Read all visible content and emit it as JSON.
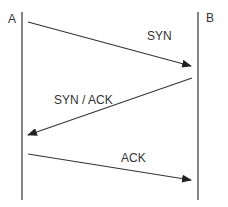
{
  "diagram": {
    "title": "",
    "type": "sequence",
    "participants": [
      {
        "id": "A",
        "label": "A",
        "x": 22
      },
      {
        "id": "B",
        "label": "B",
        "x": 198
      }
    ],
    "messages": [
      {
        "label": "SYN",
        "from": "A",
        "to": "B",
        "x1": 28,
        "y1": 22,
        "x2": 191,
        "y2": 66,
        "label_x": 147,
        "label_y": 37
      },
      {
        "label": "SYN / ACK",
        "from": "B",
        "to": "A",
        "x1": 192,
        "y1": 78,
        "x2": 28,
        "y2": 135,
        "label_x": 54,
        "label_y": 105
      },
      {
        "label": "ACK",
        "from": "A",
        "to": "B",
        "x1": 28,
        "y1": 154,
        "x2": 191,
        "y2": 180,
        "label_x": 121,
        "label_y": 161
      }
    ],
    "colors": {
      "line": "#333333",
      "text": "#333333",
      "background": "#ffffff"
    }
  }
}
